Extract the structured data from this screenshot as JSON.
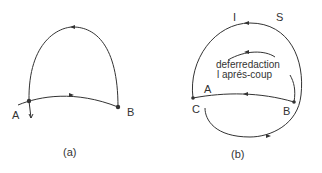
{
  "figure_a": {
    "caption": "(a)",
    "labels": {
      "A": "A",
      "B": "B"
    }
  },
  "figure_b": {
    "caption": "(b)",
    "labels": {
      "I": "I",
      "S": "S",
      "A": "A",
      "B": "B",
      "C": "C"
    },
    "inner_text_line1": "deferredaction",
    "inner_text_line2": "l aprés-coup"
  },
  "colors": {
    "stroke": "#333333",
    "background": "#ffffff"
  }
}
